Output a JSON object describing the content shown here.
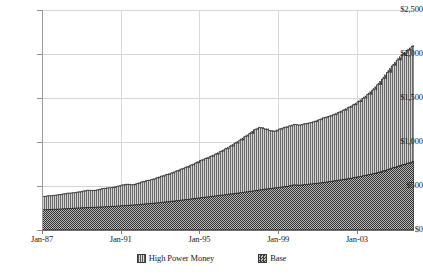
{
  "chart_data": {
    "type": "area",
    "stacked": true,
    "title": "",
    "subtitle": "",
    "xlabel": "",
    "ylabel": "",
    "ylim": [
      0,
      2500
    ],
    "ytick_values": [
      0,
      500,
      1000,
      1500,
      2000,
      2500
    ],
    "ytick_labels": [
      "$0",
      "$500",
      "$1,000",
      "$1,500",
      "$2,000",
      "$2,500"
    ],
    "xtick_labels": [
      "Jan-87",
      "Jan-91",
      "Jan-95",
      "Jan-99",
      "Jan-03"
    ],
    "xtick_values": [
      1987,
      1991,
      1995,
      1999,
      2003
    ],
    "xlim": [
      1987.0,
      2005.9
    ],
    "grid": true,
    "legend_position": "bottom",
    "legend": [
      "High Power Money",
      "Base"
    ],
    "series": [
      {
        "name": "High Power Money",
        "fill": "vertical-stripes",
        "color": "#9e9e9e",
        "note": "upper band; values below are the stacked TOTAL (top boundary of chart)",
        "x": [
          1987.0,
          1987.25,
          1987.5,
          1987.75,
          1988.0,
          1988.25,
          1988.5,
          1988.75,
          1989.0,
          1989.25,
          1989.5,
          1989.75,
          1990.0,
          1990.25,
          1990.5,
          1990.75,
          1991.0,
          1991.25,
          1991.5,
          1991.75,
          1992.0,
          1992.25,
          1992.5,
          1992.75,
          1993.0,
          1993.25,
          1993.5,
          1993.75,
          1994.0,
          1994.25,
          1994.5,
          1994.75,
          1995.0,
          1995.25,
          1995.5,
          1995.75,
          1996.0,
          1996.25,
          1996.5,
          1996.75,
          1997.0,
          1997.25,
          1997.5,
          1997.75,
          1998.0,
          1998.25,
          1998.5,
          1998.75,
          1999.0,
          1999.25,
          1999.5,
          1999.75,
          2000.0,
          2000.25,
          2000.5,
          2000.75,
          2001.0,
          2001.25,
          2001.5,
          2001.75,
          2002.0,
          2002.25,
          2002.5,
          2002.75,
          2003.0,
          2003.25,
          2003.5,
          2003.75,
          2004.0,
          2004.25,
          2004.5,
          2004.75,
          2005.0,
          2005.25,
          2005.5,
          2005.75,
          2005.9
        ],
        "values": [
          380,
          388,
          392,
          400,
          408,
          418,
          422,
          430,
          440,
          452,
          448,
          455,
          470,
          478,
          482,
          495,
          510,
          520,
          512,
          525,
          545,
          560,
          572,
          590,
          610,
          628,
          645,
          668,
          690,
          712,
          735,
          760,
          790,
          812,
          835,
          860,
          890,
          920,
          950,
          985,
          1020,
          1060,
          1095,
          1140,
          1165,
          1150,
          1130,
          1120,
          1145,
          1165,
          1180,
          1200,
          1190,
          1205,
          1215,
          1230,
          1250,
          1275,
          1290,
          1310,
          1335,
          1360,
          1390,
          1420,
          1455,
          1495,
          1540,
          1590,
          1650,
          1715,
          1790,
          1865,
          1930,
          1990,
          2040,
          2085,
          2100
        ]
      },
      {
        "name": "Base",
        "fill": "checkerboard",
        "color": "#4a4a4a",
        "note": "lower band; values are the Base series itself",
        "x": [
          1987.0,
          1987.25,
          1987.5,
          1987.75,
          1988.0,
          1988.25,
          1988.5,
          1988.75,
          1989.0,
          1989.25,
          1989.5,
          1989.75,
          1990.0,
          1990.25,
          1990.5,
          1990.75,
          1991.0,
          1991.25,
          1991.5,
          1991.75,
          1992.0,
          1992.25,
          1992.5,
          1992.75,
          1993.0,
          1993.25,
          1993.5,
          1993.75,
          1994.0,
          1994.25,
          1994.5,
          1994.75,
          1995.0,
          1995.25,
          1995.5,
          1995.75,
          1996.0,
          1996.25,
          1996.5,
          1996.75,
          1997.0,
          1997.25,
          1997.5,
          1997.75,
          1998.0,
          1998.25,
          1998.5,
          1998.75,
          1999.0,
          1999.25,
          1999.5,
          1999.75,
          2000.0,
          2000.25,
          2000.5,
          2000.75,
          2001.0,
          2001.25,
          2001.5,
          2001.75,
          2002.0,
          2002.25,
          2002.5,
          2002.75,
          2003.0,
          2003.25,
          2003.5,
          2003.75,
          2004.0,
          2004.25,
          2004.5,
          2004.75,
          2005.0,
          2005.25,
          2005.5,
          2005.75,
          2005.9
        ],
        "values": [
          230,
          232,
          234,
          236,
          240,
          243,
          246,
          249,
          252,
          255,
          257,
          259,
          262,
          265,
          268,
          271,
          275,
          279,
          283,
          287,
          292,
          297,
          302,
          307,
          313,
          319,
          325,
          331,
          338,
          345,
          352,
          359,
          366,
          373,
          380,
          387,
          394,
          401,
          408,
          415,
          422,
          430,
          438,
          446,
          455,
          463,
          470,
          477,
          484,
          492,
          500,
          512,
          508,
          514,
          520,
          526,
          533,
          540,
          548,
          556,
          565,
          574,
          583,
          593,
          603,
          614,
          626,
          638,
          652,
          668,
          686,
          704,
          722,
          740,
          757,
          772,
          780
        ]
      }
    ]
  }
}
